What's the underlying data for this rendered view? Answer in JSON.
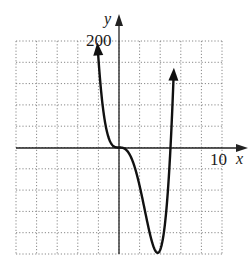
{
  "chart_data": {
    "type": "line",
    "title": "",
    "xlabel": "x",
    "ylabel": "y",
    "xlim": [
      -10,
      10
    ],
    "ylim": [
      -200,
      200
    ],
    "x_grid_step": 2,
    "y_grid_step": 40,
    "grid": true,
    "grid_style": "dotted",
    "tick_labels": {
      "x_max_label": "10",
      "y_max_label": "200"
    },
    "function": "y = 3x^4 - 15x^3",
    "series": [
      {
        "name": "f(x)",
        "x_range": [
          -2.05,
          5.3
        ],
        "points": [
          {
            "x": -2,
            "y": 168
          },
          {
            "x": -1,
            "y": 18
          },
          {
            "x": 0,
            "y": 0
          },
          {
            "x": 1,
            "y": -12
          },
          {
            "x": 2,
            "y": -72
          },
          {
            "x": 3,
            "y": -162
          },
          {
            "x": 3.75,
            "y": -198
          },
          {
            "x": 4,
            "y": -192
          },
          {
            "x": 5,
            "y": 0
          },
          {
            "x": 5.3,
            "y": 134
          }
        ],
        "arrows_at_ends": true
      }
    ],
    "annotations": []
  },
  "labels": {
    "x_axis": "x",
    "y_axis": "y",
    "x_tick": "10",
    "y_tick": "200"
  },
  "colors": {
    "curve": "#111111",
    "axis": "#222222",
    "grid": "#888888"
  }
}
